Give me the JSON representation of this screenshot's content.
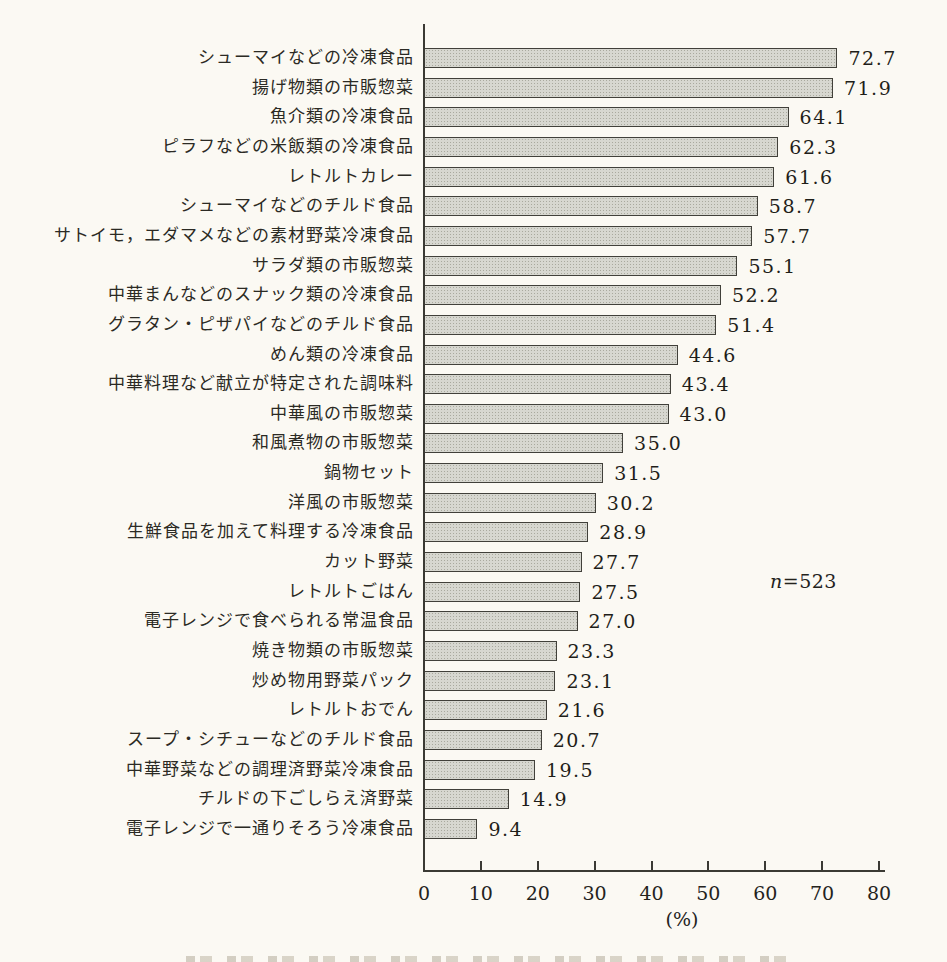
{
  "chart_data": {
    "type": "bar",
    "orientation": "horizontal",
    "title": "",
    "xlabel": "(%)",
    "xlim": [
      0,
      80
    ],
    "xticks": [
      0,
      10,
      20,
      30,
      40,
      50,
      60,
      70,
      80
    ],
    "grid": false,
    "legend_position": "none",
    "sample_annotation": "n=523",
    "bar_fill": "#d7d7d0",
    "bar_border": "#41403a",
    "background": "#fbf9f3",
    "categories": [
      "シューマイなどの冷凍食品",
      "揚げ物類の市販惣菜",
      "魚介類の冷凍食品",
      "ピラフなどの米飯類の冷凍食品",
      "レトルトカレー",
      "シューマイなどのチルド食品",
      "サトイモ，エダマメなどの素材野菜冷凍食品",
      "サラダ類の市販惣菜",
      "中華まんなどのスナック類の冷凍食品",
      "グラタン・ピザパイなどのチルド食品",
      "めん類の冷凍食品",
      "中華料理など献立が特定された調味料",
      "中華風の市販惣菜",
      "和風煮物の市販惣菜",
      "鍋物セット",
      "洋風の市販惣菜",
      "生鮮食品を加えて料理する冷凍食品",
      "カット野菜",
      "レトルトごはん",
      "電子レンジで食べられる常温食品",
      "焼き物類の市販惣菜",
      "炒め物用野菜パック",
      "レトルトおでん",
      "スープ・シチューなどのチルド食品",
      "中華野菜などの調理済野菜冷凍食品",
      "チルドの下ごしらえ済野菜",
      "電子レンジで一通りそろう冷凍食品"
    ],
    "values": [
      72.7,
      71.9,
      64.1,
      62.3,
      61.6,
      58.7,
      57.7,
      55.1,
      52.2,
      51.4,
      44.6,
      43.4,
      43.0,
      35.0,
      31.5,
      30.2,
      28.9,
      27.7,
      27.5,
      27.0,
      23.3,
      23.1,
      21.6,
      20.7,
      19.5,
      14.9,
      9.4
    ]
  },
  "annotation": {
    "n_prefix": "n",
    "n_suffix": "=523"
  },
  "axis": {
    "unit_label": "(%)",
    "tick_labels": [
      "0",
      "10",
      "20",
      "30",
      "40",
      "50",
      "60",
      "70",
      "80"
    ]
  }
}
